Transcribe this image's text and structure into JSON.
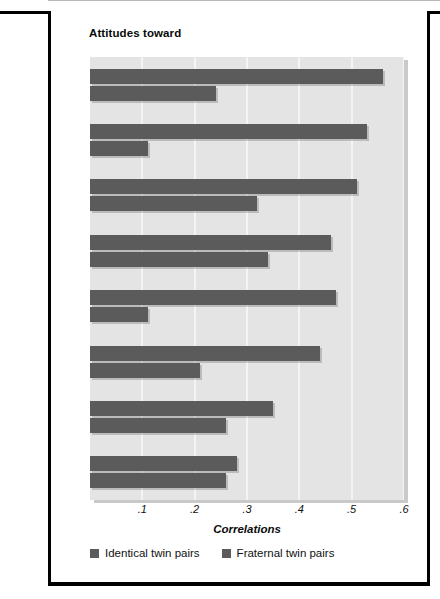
{
  "figure": {
    "title": "Attitudes toward"
  },
  "chart_data": {
    "type": "bar",
    "orientation": "horizontal",
    "title": "Attitudes toward",
    "xlabel": "Correlations",
    "ylabel": "",
    "xlim": [
      0.0,
      0.6
    ],
    "xticks": [
      ".1",
      ".2",
      ".3",
      ".4",
      ".5",
      ".6"
    ],
    "xtick_values": [
      0.1,
      0.2,
      0.3,
      0.4,
      0.5,
      0.6
    ],
    "grid": true,
    "legend_position": "bottom-left",
    "categories": [
      "Reading books",
      "Playing sports",
      "Roller coasters",
      "The death penalty",
      "Crossword puzzles",
      "Organized religion",
      "Public speaking",
      "Traditional sex roles"
    ],
    "category_lines": [
      [
        "Reading",
        "books"
      ],
      [
        "Playing",
        "sports"
      ],
      [
        "Roller",
        "coasters"
      ],
      [
        "The death",
        "penalty"
      ],
      [
        "Crossword",
        "puzzles"
      ],
      [
        "Organized",
        "religion"
      ],
      [
        "Public",
        "speaking"
      ],
      [
        "Traditional",
        "sex roles"
      ]
    ],
    "series": [
      {
        "name": "Identical twin pairs",
        "color": "#5b5b5b",
        "values": [
          0.56,
          0.53,
          0.51,
          0.46,
          0.47,
          0.44,
          0.35,
          0.28
        ]
      },
      {
        "name": "Fraternal twin pairs",
        "color": "#5b5b5b",
        "values": [
          0.24,
          0.11,
          0.32,
          0.34,
          0.11,
          0.21,
          0.26,
          0.26
        ]
      }
    ]
  },
  "legend": [
    {
      "label": "Identical twin pairs",
      "color": "#5b5b5b"
    },
    {
      "label": "Fraternal twin pairs",
      "color": "#5b5b5b"
    }
  ],
  "colors": {
    "bar": "#5b5b5b",
    "plot_background": "#e4e4e4",
    "gridline": "#f4f4f4",
    "frame": "#000000"
  }
}
